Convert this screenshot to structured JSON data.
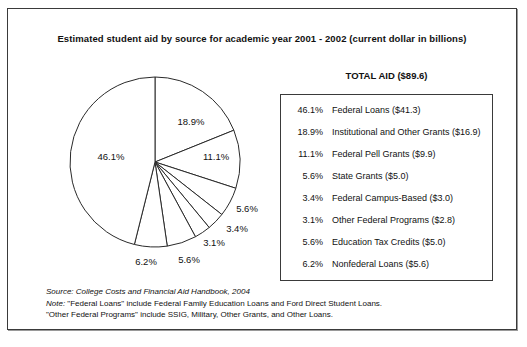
{
  "chart_data": {
    "type": "pie",
    "title": "Estimated student aid by source for academic year 2001 - 2002 (current dollar in billions)",
    "total_label": "TOTAL AID ($89.6)",
    "total_value": 89.6,
    "unit": "billions of current dollars",
    "start_angle_deg": 0,
    "direction": "clockwise",
    "legend_position": "right",
    "categories": [
      "Institutional and Other Grants",
      "Federal Pell Grants",
      "State Grants",
      "Federal Campus-Based",
      "Other Federal Programs",
      "Education Tax Credits",
      "Nonfederal Loans",
      "Federal Loans"
    ],
    "values": [
      18.9,
      11.1,
      5.6,
      3.4,
      3.1,
      5.6,
      6.2,
      46.1
    ],
    "amounts": [
      16.9,
      9.9,
      5.0,
      3.0,
      2.8,
      5.0,
      5.6,
      41.3
    ],
    "slice_labels": [
      "18.9%",
      "11.1%",
      "5.6%",
      "3.4%",
      "3.1%",
      "5.6%",
      "6.2%",
      "46.1%"
    ]
  },
  "header": {
    "title": "Estimated student aid by source for academic year 2001 - 2002 (current dollar in billions)"
  },
  "pie": {
    "labels": [
      {
        "text": "18.9%",
        "x": 183,
        "y": 112
      },
      {
        "text": "11.1%",
        "x": 208,
        "y": 147
      },
      {
        "text": "5.6%",
        "x": 239,
        "y": 199
      },
      {
        "text": "3.4%",
        "x": 229,
        "y": 219
      },
      {
        "text": "3.1%",
        "x": 206,
        "y": 233
      },
      {
        "text": "5.6%",
        "x": 181,
        "y": 250
      },
      {
        "text": "6.2%",
        "x": 138,
        "y": 252
      },
      {
        "text": "46.1%",
        "x": 103,
        "y": 147
      }
    ]
  },
  "legend": {
    "heading": "TOTAL AID ($89.6)",
    "rows": [
      {
        "pct": "46.1%",
        "text": "Federal Loans ($41.3)"
      },
      {
        "pct": "18.9%",
        "text": "Institutional and Other Grants ($16.9)"
      },
      {
        "pct": "11.1%",
        "text": "Federal Pell Grants ($9.9)"
      },
      {
        "pct": "5.6%",
        "text": "State Grants ($5.0)"
      },
      {
        "pct": "3.4%",
        "text": "Federal Campus-Based ($3.0)"
      },
      {
        "pct": "3.1%",
        "text": "Other Federal Programs ($2.8)"
      },
      {
        "pct": "5.6%",
        "text": "Education Tax Credits ($5.0)"
      },
      {
        "pct": "6.2%",
        "text": "Nonfederal Loans ($5.6)"
      }
    ]
  },
  "notes": {
    "source": "Source:  College Costs and Financial Aid Handbook, 2004",
    "note_label": "Note:",
    "note_text": "  \"Federal Loans\" include Federal Family Education Loans and Ford Direct Student Loans.",
    "note_line2": "\"Other Federal Programs\" include SSIG, Military, Other Grants, and Other Loans."
  }
}
